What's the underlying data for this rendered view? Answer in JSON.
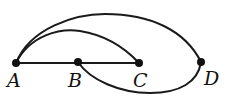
{
  "diagram": {
    "type": "graph",
    "nodes": [
      {
        "id": "A",
        "label": "A",
        "x": 16,
        "y": 63,
        "label_x": 6,
        "label_y": 86
      },
      {
        "id": "B",
        "label": "B",
        "x": 78,
        "y": 62,
        "label_x": 68,
        "label_y": 86
      },
      {
        "id": "C",
        "label": "C",
        "x": 139,
        "y": 63,
        "label_x": 133,
        "label_y": 86
      },
      {
        "id": "D",
        "label": "D",
        "x": 201,
        "y": 62,
        "label_x": 205,
        "label_y": 84
      }
    ],
    "edges": [
      {
        "from": "A",
        "to": "C",
        "shape": "straight",
        "note": "segment A-B-C"
      },
      {
        "from": "A",
        "to": "C",
        "shape": "upper-arc"
      },
      {
        "from": "A",
        "to": "D",
        "shape": "upper-arc"
      },
      {
        "from": "B",
        "to": "D",
        "shape": "lower-arc"
      }
    ],
    "colors": {
      "stroke": "#1a1a1a",
      "node": "#111111",
      "background": "#ffffff"
    }
  }
}
